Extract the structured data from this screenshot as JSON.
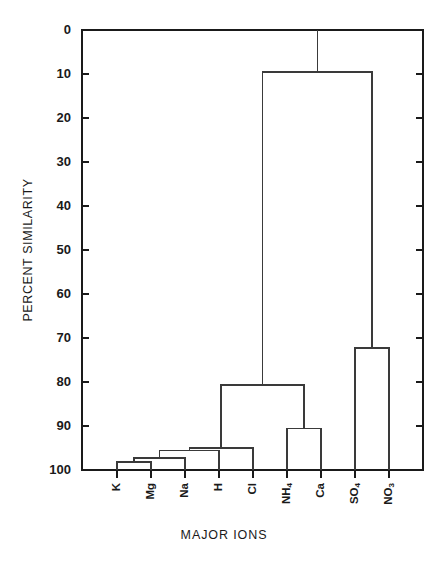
{
  "chart_data": {
    "type": "line",
    "subtype": "dendrogram",
    "title": "",
    "xlabel": "MAJOR IONS",
    "ylabel": "PERCENT SIMILARITY",
    "ylim": [
      0,
      100
    ],
    "y_axis_inverted": true,
    "grid": false,
    "legend": null,
    "y_ticks": [
      0,
      10,
      20,
      30,
      40,
      50,
      60,
      70,
      80,
      90,
      100
    ],
    "y_tick_labels": [
      "0",
      "10",
      "20",
      "30",
      "40",
      "50",
      "60",
      "70",
      "80",
      "90",
      "100"
    ],
    "leaves": [
      {
        "index": 0,
        "label": "K",
        "base": "K",
        "sub": ""
      },
      {
        "index": 1,
        "label": "Mg",
        "base": "Mg",
        "sub": ""
      },
      {
        "index": 2,
        "label": "Na",
        "base": "Na",
        "sub": ""
      },
      {
        "index": 3,
        "label": "H",
        "base": "H",
        "sub": ""
      },
      {
        "index": 4,
        "label": "Cl",
        "base": "Cl",
        "sub": ""
      },
      {
        "index": 5,
        "label": "NH4",
        "base": "NH",
        "sub": "4"
      },
      {
        "index": 6,
        "label": "Ca",
        "base": "Ca",
        "sub": ""
      },
      {
        "index": 7,
        "label": "SO4",
        "base": "SO",
        "sub": "4"
      },
      {
        "index": 8,
        "label": "NO3",
        "base": "NO",
        "sub": "3"
      }
    ],
    "merges": [
      {
        "id": "m1",
        "left": "K",
        "right": "Mg",
        "similarity": 98.2
      },
      {
        "id": "m2",
        "left": "m1",
        "right": "Na",
        "similarity": 97.3
      },
      {
        "id": "m3",
        "left": "m2",
        "right": "H",
        "similarity": 95.5
      },
      {
        "id": "m4",
        "left": "m3",
        "right": "Cl",
        "similarity": 95.0
      },
      {
        "id": "m5",
        "left": "NH4",
        "right": "Ca",
        "similarity": 90.5
      },
      {
        "id": "m6",
        "left": "m4",
        "right": "m5",
        "similarity": 80.7
      },
      {
        "id": "m7",
        "left": "SO4",
        "right": "NO3",
        "similarity": 72.3
      },
      {
        "id": "m8",
        "left": "m6",
        "right": "m7",
        "similarity": 9.5
      },
      {
        "id": "root",
        "left": "m8",
        "right": null,
        "similarity": 0
      }
    ],
    "axis_color": "#1a1a1a",
    "link_color": "#3a3a3a",
    "background_color": "#ffffff"
  }
}
